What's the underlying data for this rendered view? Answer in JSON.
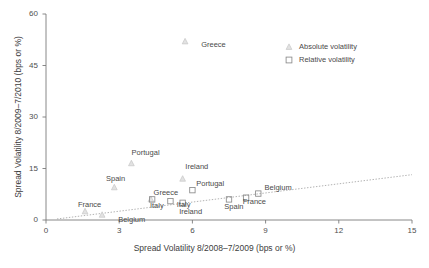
{
  "chart_data": {
    "type": "scatter",
    "title": "",
    "xlabel": "Spread Volatility 8/2008–7/2009 (bps or %)",
    "ylabel": "Spread Volatility 8/2009–7/2010 (bps or %)",
    "xlim": [
      0,
      15
    ],
    "ylim": [
      0,
      60
    ],
    "xticks": [
      "0",
      "3",
      "6",
      "9",
      "12",
      "15"
    ],
    "xtick_values": [
      0,
      3,
      6,
      9,
      12,
      15
    ],
    "yticks": [
      "0",
      "15",
      "30",
      "45",
      "60"
    ],
    "ytick_values": [
      0,
      15,
      30,
      45,
      60
    ],
    "grid": false,
    "legend_position": "top-right",
    "series": [
      {
        "name": "Absolute volatility",
        "marker": "triangle",
        "color": "#cfcfcf",
        "points": [
          {
            "label": "Greece",
            "x": 5.7,
            "y": 52.0
          },
          {
            "label": "Portugal",
            "x": 3.5,
            "y": 16.5
          },
          {
            "label": "Spain",
            "x": 2.8,
            "y": 9.5
          },
          {
            "label": "Ireland",
            "x": 5.6,
            "y": 12.0
          },
          {
            "label": "Italy",
            "x": 4.3,
            "y": 6.0
          },
          {
            "label": "France",
            "x": 1.6,
            "y": 2.5
          },
          {
            "label": "Belgium",
            "x": 2.3,
            "y": 1.5
          }
        ]
      },
      {
        "name": "Relative volatility",
        "marker": "square",
        "color": "#8a8a8a",
        "points": [
          {
            "label": "Greece",
            "x": 4.35,
            "y": 6.0
          },
          {
            "label": "Italy",
            "x": 5.1,
            "y": 5.5
          },
          {
            "label": "Ireland",
            "x": 5.6,
            "y": 5.0
          },
          {
            "label": "Portugal",
            "x": 6.0,
            "y": 8.7
          },
          {
            "label": "Spain",
            "x": 7.5,
            "y": 6.0
          },
          {
            "label": "France",
            "x": 8.2,
            "y": 6.5
          },
          {
            "label": "Belgium",
            "x": 8.7,
            "y": 7.7
          }
        ]
      }
    ],
    "trendline": {
      "x0": 0.45,
      "y0": 0.3,
      "x1": 15.0,
      "y1": 13.2,
      "style": "dotted"
    },
    "annotations": [
      {
        "text": "Greece",
        "x": 6.4,
        "y": 51.0,
        "series": "absolute"
      },
      {
        "text": "Portugal",
        "x": 3.55,
        "y": 19.5,
        "series": "absolute"
      },
      {
        "text": "Spain",
        "x": 2.5,
        "y": 12.0,
        "series": "absolute"
      },
      {
        "text": "Ireland",
        "x": 5.75,
        "y": 15.3,
        "series": "absolute"
      },
      {
        "text": "Italy",
        "x": 4.3,
        "y": 4.0,
        "series": "absolute"
      },
      {
        "text": "France",
        "x": 1.35,
        "y": 4.4,
        "series": "absolute"
      },
      {
        "text": "Belgium",
        "x": 3.0,
        "y": 0.1,
        "series": "absolute"
      },
      {
        "text": "Greece",
        "x": 4.45,
        "y": 8.0,
        "series": "relative"
      },
      {
        "text": "Italy",
        "x": 5.4,
        "y": 4.4,
        "series": "relative"
      },
      {
        "text": "Ireland",
        "x": 5.5,
        "y": 2.4,
        "series": "relative"
      },
      {
        "text": "Portugal",
        "x": 6.2,
        "y": 10.6,
        "series": "relative"
      },
      {
        "text": "Spain",
        "x": 7.35,
        "y": 3.7,
        "series": "relative"
      },
      {
        "text": "France",
        "x": 8.1,
        "y": 5.2,
        "series": "relative"
      },
      {
        "text": "Belgium",
        "x": 9.0,
        "y": 9.2,
        "series": "relative"
      }
    ]
  },
  "legend": {
    "items": [
      {
        "label": "Absolute volatility",
        "marker": "triangle"
      },
      {
        "label": "Relative volatility",
        "marker": "square"
      }
    ]
  }
}
